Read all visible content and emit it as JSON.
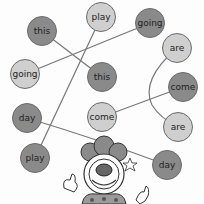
{
  "colors": {
    "dark_bubble": "#8a8a8a",
    "light_bubble": "#cfcfcf",
    "line": "#777777"
  },
  "bubbles": [
    {
      "id": "this-top",
      "label": "this",
      "tone": "dark",
      "x": 42,
      "y": 31
    },
    {
      "id": "play-top",
      "label": "play",
      "tone": "light",
      "x": 101,
      "y": 17
    },
    {
      "id": "going-top",
      "label": "going",
      "tone": "dark",
      "x": 150,
      "y": 23
    },
    {
      "id": "going-left",
      "label": "going",
      "tone": "light",
      "x": 25,
      "y": 74
    },
    {
      "id": "this-mid",
      "label": "this",
      "tone": "dark",
      "x": 102,
      "y": 77
    },
    {
      "id": "are-top",
      "label": "are",
      "tone": "light",
      "x": 177,
      "y": 48
    },
    {
      "id": "come-right",
      "label": "come",
      "tone": "dark",
      "x": 183,
      "y": 87
    },
    {
      "id": "day-left",
      "label": "day",
      "tone": "dark",
      "x": 27,
      "y": 118
    },
    {
      "id": "come-mid",
      "label": "come",
      "tone": "light",
      "x": 102,
      "y": 117
    },
    {
      "id": "are-bottom",
      "label": "are",
      "tone": "light",
      "x": 178,
      "y": 127
    },
    {
      "id": "play-bottom",
      "label": "play",
      "tone": "dark",
      "x": 35,
      "y": 158
    },
    {
      "id": "day-right",
      "label": "day",
      "tone": "dark",
      "x": 167,
      "y": 165
    }
  ],
  "connections": [
    {
      "from": "this-top",
      "to": "this-mid"
    },
    {
      "from": "going-left",
      "to": "going-top"
    },
    {
      "from": "play-top",
      "to": "play-bottom"
    },
    {
      "from": "day-left",
      "to": "day-right"
    },
    {
      "from": "come-mid",
      "to": "come-right"
    },
    {
      "from": "are-top",
      "to": "are-bottom"
    }
  ],
  "illustration": "clown"
}
